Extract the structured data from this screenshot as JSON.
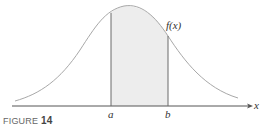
{
  "figure": {
    "caption_prefix": "FIGURE",
    "caption_number": "14",
    "function_label": "f(x)",
    "axis_label": "x",
    "lower_bound_label": "a",
    "upper_bound_label": "b",
    "colors": {
      "curve": "#a8a8a8",
      "shade": "#ededed",
      "axis": "#555555",
      "bound_lines": "#6a6a6a"
    }
  }
}
